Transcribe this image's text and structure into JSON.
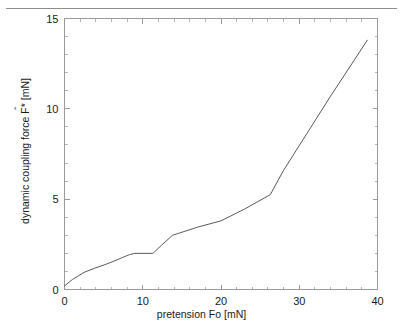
{
  "page": {
    "header_ghost_text": "",
    "rule": "horizontal-rule"
  },
  "figure": {
    "xlabel": "pretension Fo [mN]",
    "ylabel_prefix": "dynamic coupling force ",
    "ylabel_var": "F*",
    "ylabel_hat": "ˆ",
    "ylabel_suffix": " [mN]",
    "ylabel_full": "dynamic coupling force F̂* [mN]"
  },
  "chart_data": {
    "type": "line",
    "title": "",
    "subtitle": "",
    "xlabel": "pretension Fo [mN]",
    "ylabel": "dynamic coupling force F̂* [mN]",
    "xlim": [
      0,
      40
    ],
    "ylim": [
      0,
      15
    ],
    "xticks": [
      0,
      10,
      20,
      30,
      40
    ],
    "xticklabels": [
      "0",
      "10",
      "20",
      "30",
      "40"
    ],
    "yticks": [
      0,
      5,
      10,
      15
    ],
    "yticklabels": [
      "0",
      "5",
      "10",
      "15"
    ],
    "x_minor_tick_step": 2,
    "y_minor_tick_step": 1,
    "grid": false,
    "legend": null,
    "legend_position": "none",
    "annotations": [],
    "line_color": "#5a5a5a",
    "frame_color": "#9a9a9a",
    "series": [
      {
        "name": "dynamic coupling force",
        "x": [
          0.0,
          1.0,
          2.5,
          4.0,
          5.2,
          6.2,
          7.3,
          8.3,
          9.0,
          11.3,
          12.4,
          13.8,
          17.0,
          20.0,
          23.0,
          26.3,
          28.0,
          31.0,
          34.0,
          38.7
        ],
        "y": [
          0.2,
          0.55,
          0.95,
          1.2,
          1.38,
          1.55,
          1.75,
          1.93,
          2.0,
          2.0,
          2.45,
          3.0,
          3.45,
          3.8,
          4.45,
          5.25,
          6.6,
          8.65,
          10.7,
          13.8
        ]
      }
    ]
  }
}
